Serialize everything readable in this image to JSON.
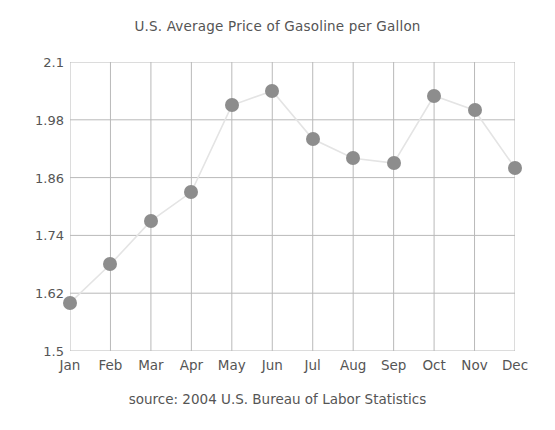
{
  "chart_data": {
    "type": "line",
    "title": "U.S. Average Price of Gasoline per Gallon",
    "source": "source: 2004 U.S. Bureau of Labor Statistics",
    "xlabel": "",
    "ylabel": "",
    "categories": [
      "Jan",
      "Feb",
      "Mar",
      "Apr",
      "May",
      "Jun",
      "Jul",
      "Aug",
      "Sep",
      "Oct",
      "Nov",
      "Dec"
    ],
    "values": [
      1.6,
      1.68,
      1.77,
      1.83,
      2.01,
      2.04,
      1.94,
      1.9,
      1.89,
      2.03,
      2.0,
      1.88
    ],
    "ylim": [
      1.5,
      2.1
    ],
    "ytick_labels": [
      "2.1",
      "1.98",
      "1.86",
      "1.74",
      "1.62",
      "1.5"
    ],
    "ytick_values": [
      2.1,
      1.98,
      1.86,
      1.74,
      1.62,
      1.5
    ],
    "grid": true,
    "legend": "none",
    "marker_color": "#8d8d8d",
    "line_color": "#e4e4e4",
    "grid_color": "#b9b9b9",
    "text_color": "#555555"
  }
}
